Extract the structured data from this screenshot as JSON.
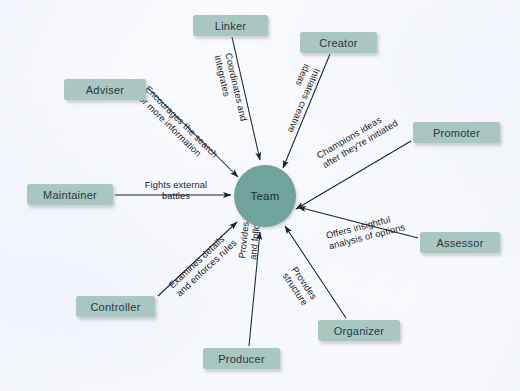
{
  "diagram": {
    "type": "hub-and-spoke",
    "colors": {
      "hub_fill": "#6FA39B",
      "node_fill": "#A9C6C0",
      "node_text": "#243a42",
      "arrow": "#18232b",
      "background": "#fdfdff"
    },
    "hub": {
      "label": "Team",
      "cx": 265,
      "cy": 196,
      "r": 31
    },
    "nodes": [
      {
        "id": "linker",
        "label": "Linker",
        "x": 193,
        "y": 15,
        "w": 75,
        "h": 21
      },
      {
        "id": "creator",
        "label": "Creator",
        "x": 300,
        "y": 32,
        "w": 77,
        "h": 21
      },
      {
        "id": "adviser",
        "label": "Adviser",
        "x": 64,
        "y": 79,
        "w": 82,
        "h": 21
      },
      {
        "id": "promoter",
        "label": "Promoter",
        "x": 413,
        "y": 122,
        "w": 87,
        "h": 21
      },
      {
        "id": "maintainer",
        "label": "Maintainer",
        "x": 27,
        "y": 184,
        "w": 86,
        "h": 21
      },
      {
        "id": "assessor",
        "label": "Assessor",
        "x": 420,
        "y": 232,
        "w": 80,
        "h": 21
      },
      {
        "id": "controller",
        "label": "Controller",
        "x": 76,
        "y": 296,
        "w": 79,
        "h": 21
      },
      {
        "id": "organizer",
        "label": "Organizer",
        "x": 318,
        "y": 320,
        "w": 82,
        "h": 21
      },
      {
        "id": "producer",
        "label": "Producer",
        "x": 203,
        "y": 348,
        "w": 77,
        "h": 21
      }
    ],
    "edges": [
      {
        "id": "linker-to-team",
        "from": "linker",
        "to": "Team",
        "label": "Coordinates and\ninteg­rates",
        "label_lines": [
          "Coordinates and",
          "integrates"
        ],
        "direction": "to-hub"
      },
      {
        "id": "creator-to-team",
        "from": "creator",
        "to": "Team",
        "label": "Initiates creative\nideas",
        "label_lines": [
          "Initiates creative",
          "ideas"
        ],
        "direction": "to-hub"
      },
      {
        "id": "adviser-to-team",
        "from": "adviser",
        "to": "Team",
        "label": "Encourages the search\nfor more information",
        "label_lines": [
          "Encourages the search",
          "for more information"
        ],
        "direction": "to-hub"
      },
      {
        "id": "promoter-to-team",
        "from": "promoter",
        "to": "Team",
        "label": "Champions ideas\nafter they're initiated",
        "label_lines": [
          "Champions ideas",
          "after they're initiated"
        ],
        "direction": "to-hub"
      },
      {
        "id": "maintainer-to-team",
        "from": "maintainer",
        "to": "Team",
        "label": "Fights external\nbattles",
        "label_lines": [
          "Fights external",
          "battles"
        ],
        "direction": "to-hub"
      },
      {
        "id": "assessor-to-team",
        "from": "assessor",
        "to": "Team",
        "label": "Offers insightful\nanalysis of options",
        "label_lines": [
          "Offers insightful",
          "analysis of options"
        ],
        "direction": "to-hub"
      },
      {
        "id": "controller-to-team",
        "from": "controller",
        "to": "Team",
        "label": "Examines details\nand enforces rules",
        "label_lines": [
          "Examines details",
          "and enforces rules"
        ],
        "direction": "to-hub"
      },
      {
        "id": "organizer-to-team",
        "from": "organizer",
        "to": "Team",
        "label": "Provides\nstructure",
        "label_lines": [
          "Provides",
          "structure"
        ],
        "direction": "to-hub"
      },
      {
        "id": "producer-to-team",
        "from": "producer",
        "to": "Team",
        "label": "Provides direction\nand follow-through",
        "label_lines": [
          "Provides direction",
          "and follow-through"
        ],
        "direction": "to-hub"
      }
    ]
  }
}
